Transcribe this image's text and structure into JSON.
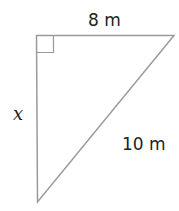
{
  "diagram": {
    "type": "right-triangle",
    "right_angle_marker": true,
    "labels": {
      "top_side": "8 m",
      "left_side": "x",
      "hypotenuse": "10 m"
    },
    "colors": {
      "stroke": "#9a9a9a",
      "text": "#222222",
      "background": "#ffffff"
    }
  }
}
